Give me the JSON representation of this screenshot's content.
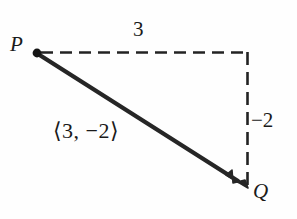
{
  "figure": {
    "type": "vector-diagram",
    "background_color": "#fefefe",
    "ink_color": "#1f1f1f",
    "points": {
      "P": {
        "label": "P",
        "x": 37,
        "y": 53
      },
      "Q": {
        "label": "Q",
        "x": 247,
        "y": 187
      }
    },
    "vector": {
      "from": "P",
      "to": "Q",
      "components_label": "⟨3, −2⟩",
      "x_component": 3,
      "y_component": -2,
      "stroke_width": 4,
      "has_arrowhead": true,
      "has_start_dot": true
    },
    "guides": {
      "horizontal": {
        "label": "3",
        "value": 3,
        "style": "dashed",
        "from_x": 40,
        "to_x": 248,
        "y": 52
      },
      "vertical": {
        "label": "−2",
        "value": -2,
        "style": "dashed",
        "x": 248,
        "from_y": 52,
        "to_y": 187
      }
    }
  }
}
